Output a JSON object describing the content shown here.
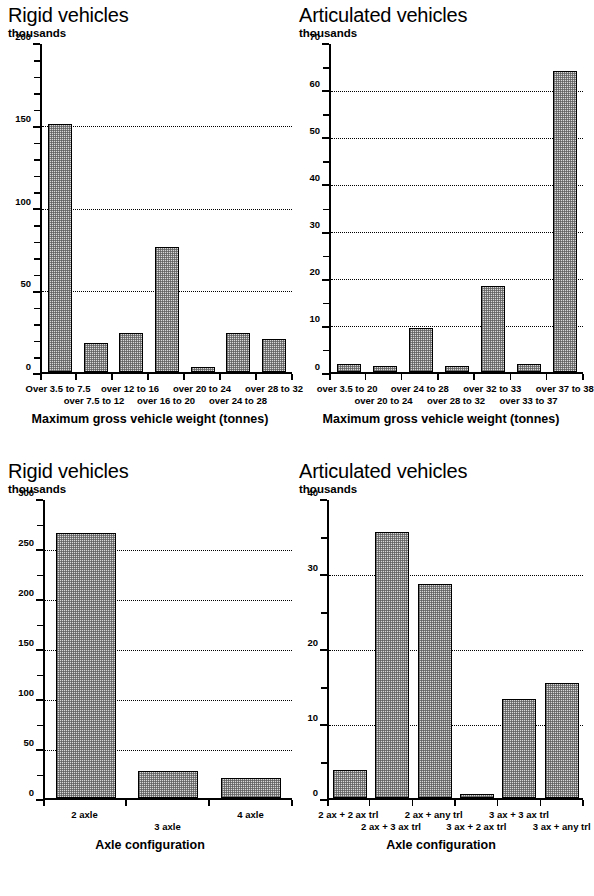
{
  "charts": [
    {
      "id": "rigid-weight",
      "title": "Rigid vehicles",
      "unit": "thousands",
      "xlabel": "Maximum gross vehicle weight (tonnes)",
      "chart_data": {
        "type": "bar",
        "title": "Rigid vehicles",
        "ylabel": "thousands",
        "xlabel": "Maximum gross vehicle weight (tonnes)",
        "ylim": [
          0,
          200
        ],
        "yticks": [
          0,
          50,
          100,
          150,
          200
        ],
        "yminor_step": 10,
        "grid": true,
        "categories": [
          "Over 3.5 to 7.5",
          "over 7.5 to 12",
          "over 12 to 16",
          "over 16 to 20",
          "over 20 to 24",
          "over 24 to 28",
          "over 28 to 32"
        ],
        "values": [
          151.5,
          17.5,
          24.0,
          76.0,
          3.0,
          24.0,
          20.0
        ]
      }
    },
    {
      "id": "artic-weight",
      "title": "Articulated vehicles",
      "unit": "thousands",
      "xlabel": "Maximum gross vehicle weight (tonnes)",
      "chart_data": {
        "type": "bar",
        "title": "Articulated vehicles",
        "ylabel": "thousands",
        "xlabel": "Maximum gross vehicle weight (tonnes)",
        "ylim": [
          0,
          70
        ],
        "yticks": [
          0,
          10,
          20,
          30,
          40,
          50,
          60,
          70
        ],
        "yminor_step": 5,
        "grid": true,
        "categories": [
          "over 3.5 to 20",
          "over 20 to 24",
          "over 24 to 28",
          "over 28 to 32",
          "over 32 to 33",
          "over 33 to 37",
          "over 37 to 38"
        ],
        "values": [
          1.7,
          1.2,
          9.5,
          1.3,
          18.3,
          1.7,
          64.3
        ]
      }
    },
    {
      "id": "rigid-axle",
      "title": "Rigid vehicles",
      "unit": "thousands",
      "xlabel": "Axle configuration",
      "chart_data": {
        "type": "bar",
        "title": "Rigid vehicles",
        "ylabel": "thousands",
        "xlabel": "Axle configuration",
        "ylim": [
          0,
          300
        ],
        "yticks": [
          0,
          50,
          100,
          150,
          200,
          250,
          300
        ],
        "yminor_step": 25,
        "grid": true,
        "categories": [
          "2 axle",
          "3 axle",
          "4 axle"
        ],
        "values": [
          267.0,
          27.0,
          20.0
        ]
      }
    },
    {
      "id": "artic-axle",
      "title": "Articulated vehicles",
      "unit": "thousands",
      "xlabel": "Axle configuration",
      "chart_data": {
        "type": "bar",
        "title": "Articulated vehicles",
        "ylabel": "thousands",
        "xlabel": "Axle configuration",
        "ylim": [
          0,
          40
        ],
        "yticks": [
          0,
          10,
          20,
          30,
          40
        ],
        "yminor_step": 5,
        "grid": true,
        "categories": [
          "2 ax + 2 ax trl",
          "2 ax + 3 ax trl",
          "2 ax + any trl",
          "3 ax + 2 ax trl",
          "3 ax + 3 ax trl",
          "3 ax + any trl"
        ],
        "values": [
          3.8,
          35.7,
          28.7,
          0.5,
          13.3,
          15.5
        ]
      }
    }
  ]
}
